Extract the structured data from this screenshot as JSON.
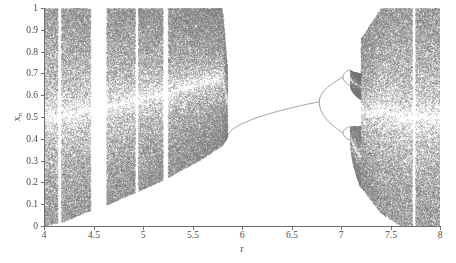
{
  "figure": {
    "title": "",
    "background": "#ffffff",
    "point_color": "#7a7a7a",
    "axis_color": "#6e6e6e"
  },
  "axes": {
    "x": {
      "label": "r",
      "min": 4,
      "max": 8,
      "ticks": [
        4,
        4.5,
        5,
        5.5,
        6,
        6.5,
        7,
        7.5,
        8
      ],
      "tick_labels": [
        "4",
        "4.5",
        "5",
        "5.5",
        "6",
        "6.5",
        "7",
        "7.5",
        "8"
      ]
    },
    "y": {
      "label_base": "x",
      "label_sub": "n",
      "min": 0,
      "max": 1,
      "ticks": [
        0,
        0.1,
        0.2,
        0.3,
        0.4,
        0.5,
        0.6,
        0.7,
        0.8,
        0.9,
        1
      ],
      "tick_labels": [
        "0",
        "0.1",
        "0.2",
        "0.3",
        "0.4",
        "0.5",
        "0.6",
        "0.7",
        "0.8",
        "0.9",
        "1"
      ]
    }
  },
  "chart_data": {
    "type": "scatter",
    "title": "",
    "xlabel": "r",
    "ylabel": "x_n",
    "xlim": [
      4,
      8
    ],
    "ylim": [
      0,
      1
    ],
    "grid": false,
    "legend": null,
    "regions": [
      {
        "name": "chaotic-band-left",
        "r_start": 4.0,
        "r_end": 5.85,
        "kind": "chaos"
      },
      {
        "name": "periodic-window-main",
        "r_start": 5.85,
        "r_end": 7.2,
        "kind": "periodic"
      },
      {
        "name": "chaotic-band-right",
        "r_start": 7.2,
        "r_end": 8.0,
        "kind": "chaos"
      }
    ],
    "periodic_windows_in_chaos": [
      {
        "r_start": 4.14,
        "r_end": 4.17
      },
      {
        "r_start": 4.47,
        "r_end": 4.63
      },
      {
        "r_start": 4.92,
        "r_end": 4.95
      },
      {
        "r_start": 5.2,
        "r_end": 5.25
      },
      {
        "r_start": 7.0,
        "r_end": 7.03
      },
      {
        "r_start": 7.72,
        "r_end": 7.75
      }
    ],
    "cascade": {
      "period1_r_range": [
        5.85,
        6.78
      ],
      "period2_r_range": [
        6.78,
        7.02
      ],
      "period4_r_range": [
        7.02,
        7.09
      ],
      "chaos_onset_r": 7.12,
      "fixed_point_at_r6": 0.46,
      "fixed_point_at_r65": 0.55,
      "upper_branch_at_r69": 0.66,
      "lower_branch_at_r69": 0.43
    },
    "series": [
      {
        "name": "attractor-points",
        "x": [
          4.0,
          4.2,
          4.4,
          4.6,
          4.8,
          5.0,
          5.2,
          5.4,
          5.6,
          5.8,
          5.9,
          6.0,
          6.2,
          6.4,
          6.5,
          6.6,
          6.7,
          6.8,
          6.9,
          7.0,
          7.1,
          7.2,
          7.4,
          7.6,
          7.8,
          8.0
        ],
        "y_min": [
          0.0,
          0.02,
          0.06,
          0.09,
          0.13,
          0.17,
          0.21,
          0.26,
          0.31,
          0.37,
          0.44,
          0.46,
          0.5,
          0.53,
          0.55,
          0.57,
          0.57,
          0.52,
          0.43,
          0.38,
          0.3,
          0.18,
          0.06,
          0.0,
          0.0,
          0.0
        ],
        "y_max": [
          1.0,
          1.0,
          1.0,
          1.0,
          1.0,
          1.0,
          1.0,
          1.0,
          1.0,
          1.0,
          0.44,
          0.46,
          0.5,
          0.53,
          0.55,
          0.57,
          0.62,
          0.66,
          0.67,
          0.68,
          0.75,
          0.86,
          1.0,
          1.0,
          1.0,
          1.0
        ]
      }
    ]
  }
}
